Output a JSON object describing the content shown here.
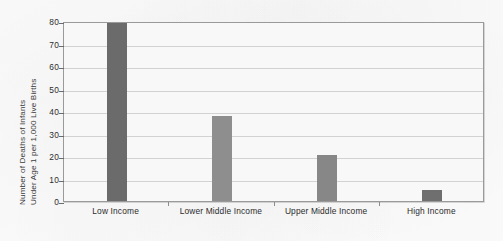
{
  "chart_data": {
    "type": "bar",
    "title": "",
    "subtitle": "",
    "xlabel": "",
    "ylabel": "Number of Deaths of Infants Under Age 1 per 1,000 Live Births",
    "ylabel_lines": [
      "Number of Deaths of Infants",
      "Under Age 1 per 1,000 Live Births"
    ],
    "categories": [
      "Low Income",
      "Lower Middle Income",
      "Upper Middle Income",
      "High Income"
    ],
    "values": [
      80,
      38,
      20.5,
      5
    ],
    "value_notes": [
      "clipped at top of axis (80 or greater)",
      "just under 40",
      "just above 20",
      "about 5"
    ],
    "ylim": [
      0,
      80
    ],
    "ytick_labels": [
      "0",
      "10",
      "20",
      "30",
      "40",
      "50",
      "60",
      "70",
      "80"
    ],
    "ytick_values": [
      0,
      10,
      20,
      30,
      40,
      50,
      60,
      70,
      80
    ],
    "grid": true,
    "legend": false,
    "legend_position": "none",
    "bar_colors": [
      "#6b6b6b",
      "#8e8e8e",
      "#878787",
      "#6f6f6f"
    ],
    "plot_background": "#f8f8f8",
    "gridline_color": "#d2d2d2",
    "axis_color": "#9a9a9a",
    "text_color": "#2b2b2b"
  }
}
